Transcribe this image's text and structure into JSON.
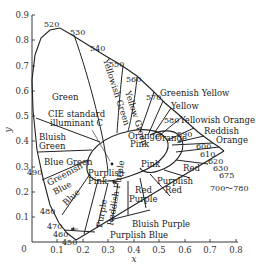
{
  "diagram": {
    "axes": {
      "xlabel": "x",
      "ylabel": "y",
      "origin_label": "0",
      "x_ticks": [
        "0.1",
        "0.2",
        "0.3",
        "0.4",
        "0.5",
        "0.6",
        "0.7",
        "0.8"
      ],
      "y_ticks": [
        "0.1",
        "0.2",
        "0.3",
        "0.4",
        "0.5",
        "0.6",
        "0.7",
        "0.8",
        "0.9"
      ]
    },
    "wavelengths": [
      "450",
      "460",
      "470",
      "480",
      "490",
      "520",
      "530",
      "540",
      "550",
      "560",
      "570",
      "580",
      "590",
      "600",
      "610",
      "620",
      "630",
      "675",
      "700～780"
    ],
    "regions": {
      "green": "Green",
      "yellowish_green": "Yellowish Green",
      "yellow_green": "Yellow Green",
      "greenish_yellow": "Greenish Yellow",
      "yellow": "Yellow",
      "yellowish_orange": "Yellowish Orange",
      "reddish_orange_1": "Reddish",
      "reddish_orange_2": "Orange",
      "orange": "Orange",
      "orange_pink_1": "Orange",
      "orange_pink_2": "Pink",
      "pink": "Pink",
      "red": "Red",
      "purplish_red_1": "Purplish",
      "purplish_red_2": "Red",
      "red_purple_1": "Red",
      "red_purple_2": "Purple",
      "reddish_purple": "Reddish Purple",
      "purple": "Purple",
      "bluish_purple": "Bluish Purple",
      "purplish_blue": "Purplish Blue",
      "blue": "Blue",
      "greenish_blue_1": "Greenish",
      "greenish_blue_2": "Blue",
      "blue_green": "Blue Green",
      "bluish_green_1": "Bluish",
      "bluish_green_2": "Green",
      "purplish_pink_1": "Purplish",
      "purplish_pink_2": "Pink",
      "illuminant_1": "CIE standard",
      "illuminant_2": "illuminant C"
    }
  }
}
